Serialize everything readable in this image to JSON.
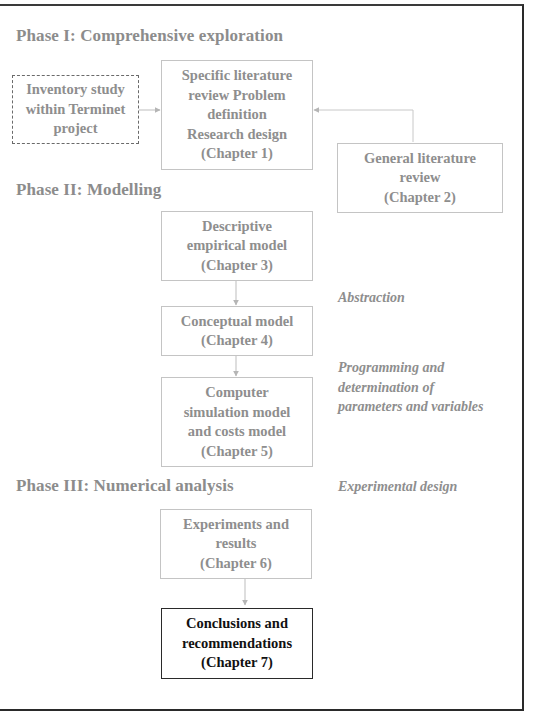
{
  "phases": {
    "phase1": "Phase I: Comprehensive exploration",
    "phase2": "Phase II: Modelling",
    "phase3": "Phase III: Numerical analysis"
  },
  "boxes": {
    "inventory": [
      "Inventory study",
      "within Terminet",
      "project"
    ],
    "chapter1": [
      "Specific literature",
      "review Problem",
      "definition",
      "Research design",
      "(Chapter 1)"
    ],
    "chapter2": [
      "General literature",
      "review",
      "(Chapter 2)"
    ],
    "chapter3": [
      "Descriptive",
      "empirical model",
      "(Chapter 3)"
    ],
    "chapter4": [
      "Conceptual model",
      "(Chapter 4)"
    ],
    "chapter5": [
      "Computer",
      "simulation model",
      "and costs model",
      "(Chapter 5)"
    ],
    "chapter6": [
      "Experiments and",
      "results",
      "(Chapter  6)"
    ],
    "chapter7": [
      "Conclusions and",
      "recommendations",
      "(Chapter 7)"
    ]
  },
  "annotations": {
    "abstraction": "Abstraction",
    "programming": [
      "Programming and",
      "determination of",
      "parameters and variables"
    ],
    "experimental": "Experimental design"
  },
  "colors": {
    "text_gray": "#8e8e8e",
    "box_border": "#c4c4c4",
    "arrow": "#b5b5b5",
    "final_border": "#2a2a2a"
  }
}
